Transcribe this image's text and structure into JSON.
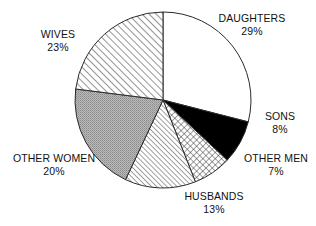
{
  "chart_data": {
    "type": "pie",
    "title": "",
    "subtitle": "",
    "xlabel": "",
    "ylabel": "",
    "legend_position": "none",
    "grid": false,
    "total": 100,
    "units": "%",
    "start_angle_deg": -90,
    "direction": "clockwise",
    "categories": [
      "DAUGHTERS",
      "SONS",
      "OTHER MEN",
      "HUSBANDS",
      "OTHER WOMEN",
      "WIVES"
    ],
    "values": [
      29,
      8,
      7,
      13,
      20,
      23
    ],
    "slices": [
      {
        "label": "DAUGHTERS",
        "value": 29,
        "percent_text": "29%",
        "fill_style": "solid-white",
        "fill_color": "#ffffff",
        "stroke_color": "#2b2b2b",
        "start_deg": -90,
        "end_deg": 14.4
      },
      {
        "label": "SONS",
        "value": 8,
        "percent_text": "8%",
        "fill_style": "solid-black",
        "fill_color": "#000000",
        "stroke_color": "#2b2b2b",
        "start_deg": 14.4,
        "end_deg": 43.2
      },
      {
        "label": "OTHER MEN",
        "value": 7,
        "percent_text": "7%",
        "fill_style": "crosshatch",
        "fill_color": "#ffffff",
        "stroke_color": "#2b2b2b",
        "start_deg": 43.2,
        "end_deg": 68.4
      },
      {
        "label": "HUSBANDS",
        "value": 13,
        "percent_text": "13%",
        "fill_style": "diagonal-hatch-fine",
        "fill_color": "#ffffff",
        "stroke_color": "#2b2b2b",
        "start_deg": 68.4,
        "end_deg": 115.2
      },
      {
        "label": "OTHER WOMEN",
        "value": 20,
        "percent_text": "20%",
        "fill_style": "gray-stipple",
        "fill_color": "#a8a8a8",
        "stroke_color": "#2b2b2b",
        "start_deg": 115.2,
        "end_deg": 187.2
      },
      {
        "label": "WIVES",
        "value": 23,
        "percent_text": "23%",
        "fill_style": "diagonal-hatch",
        "fill_color": "#ffffff",
        "stroke_color": "#2b2b2b",
        "start_deg": 187.2,
        "end_deg": 270
      }
    ]
  },
  "labels": {
    "daughters": {
      "name": "DAUGHTERS",
      "percent": "29%"
    },
    "sons": {
      "name": "SONS",
      "percent": "8%"
    },
    "other_men": {
      "name": "OTHER MEN",
      "percent": "7%"
    },
    "husbands": {
      "name": "HUSBANDS",
      "percent": "13%"
    },
    "other_women": {
      "name": "OTHER WOMEN",
      "percent": "20%"
    },
    "wives": {
      "name": "WIVES",
      "percent": "23%"
    }
  },
  "geometry": {
    "center_x": 163,
    "center_y": 100,
    "radius": 88
  }
}
